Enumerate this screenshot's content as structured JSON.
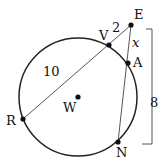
{
  "diagram": {
    "type": "geometry-circle-secants",
    "circle": {
      "center_label": "W",
      "cx": 78,
      "cy": 97,
      "r": 59
    },
    "points": [
      {
        "label": "E",
        "x": 131,
        "y": 25,
        "lx": 134,
        "ly": 19
      },
      {
        "label": "V",
        "x": 109,
        "y": 45,
        "lx": 100,
        "ly": 40
      },
      {
        "label": "A",
        "x": 128,
        "y": 63,
        "lx": 133,
        "ly": 67
      },
      {
        "label": "R",
        "x": 23,
        "y": 119,
        "lx": 6,
        "ly": 125
      },
      {
        "label": "N",
        "x": 118,
        "y": 142,
        "lx": 116,
        "ly": 157
      },
      {
        "label": "W",
        "x": 78,
        "y": 97,
        "lx": 63,
        "ly": 112
      }
    ],
    "segments": [
      {
        "from": "R",
        "to": "E"
      },
      {
        "from": "N",
        "to": "E"
      }
    ],
    "measures": {
      "RV": "10",
      "VE": "2",
      "EA": "x",
      "EN": "8"
    },
    "colors": {
      "stroke": "#222222",
      "point": "#111111",
      "background": "#ffffff"
    }
  }
}
